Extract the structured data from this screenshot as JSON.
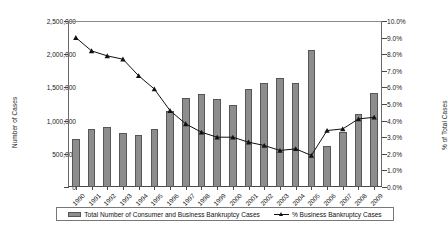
{
  "chart_data": {
    "type": "bar",
    "title": "",
    "subtitle": "",
    "xlabel": "",
    "ylabel": "Number of Cases",
    "y2label": "% of Total Cases",
    "grid": false,
    "legend_position": "bottom",
    "categories": [
      "1990",
      "1991",
      "1992",
      "1993",
      "1994",
      "1995",
      "1996",
      "1997",
      "1998",
      "1999",
      "2000",
      "2001",
      "2002",
      "2003",
      "2004",
      "2005",
      "2006",
      "2007",
      "2008",
      "2009"
    ],
    "ylim": [
      0,
      2500000
    ],
    "ytick_labels": [
      "0",
      "500,000",
      "1,000,000",
      "1,500,000",
      "2,000,000",
      "2,500,000"
    ],
    "ytick_values": [
      0,
      500000,
      1000000,
      1500000,
      2000000,
      2500000
    ],
    "y2lim": [
      0,
      10
    ],
    "y2tick_labels": [
      "0.0%",
      "1.0%",
      "2.0%",
      "3.0%",
      "4.0%",
      "5.0%",
      "6.0%",
      "7.0%",
      "8.0%",
      "9.0%",
      "10.0%"
    ],
    "y2tick_values": [
      0,
      1,
      2,
      3,
      4,
      5,
      6,
      7,
      8,
      9,
      10
    ],
    "series": [
      {
        "name": "Total Number of Consumer and Business Bankruptcy Cases",
        "type": "bar",
        "axis": "left",
        "color": "#8d8d8d",
        "edge_color": "#565656",
        "values": [
          725000,
          880000,
          900000,
          820000,
          790000,
          880000,
          1150000,
          1345000,
          1400000,
          1330000,
          1230000,
          1470000,
          1560000,
          1640000,
          1570000,
          2060000,
          620000,
          830000,
          1100000,
          1420000
        ]
      },
      {
        "name": "% Business Bankruptcy Cases",
        "type": "line",
        "axis": "right",
        "color": "#111111",
        "marker": "triangle",
        "values": [
          9.0,
          8.2,
          7.9,
          7.7,
          6.7,
          5.9,
          4.6,
          3.8,
          3.3,
          3.0,
          3.0,
          2.7,
          2.5,
          2.2,
          2.3,
          1.9,
          3.4,
          3.5,
          4.1,
          4.2
        ]
      }
    ]
  },
  "legend": {
    "items": [
      {
        "label": "Total Number of Consumer and Business Bankruptcy Cases",
        "marker": "bar-swatch"
      },
      {
        "label": "% Business Bankruptcy Cases",
        "marker": "line-triangle-swatch"
      }
    ]
  },
  "axes": {
    "left_title": "Number of Cases",
    "right_title": "% of Total Cases"
  },
  "colors": {
    "bar_fill": "#8d8d8d",
    "bar_edge": "#565656",
    "line": "#111111",
    "axis": "#4a4a4a",
    "background": "#ffffff"
  }
}
